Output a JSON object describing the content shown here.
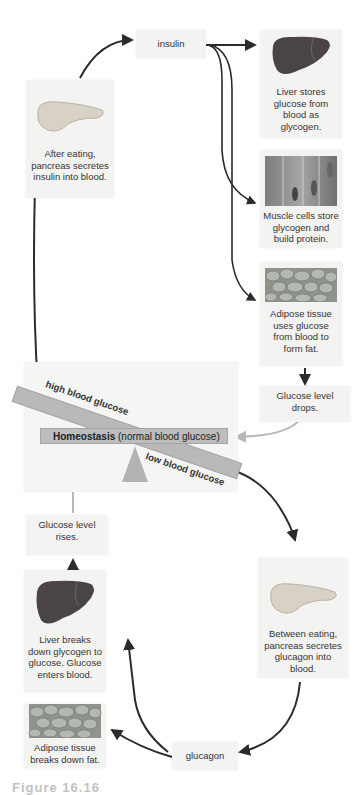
{
  "diagram": {
    "insulin_label": "insulin",
    "glucagon_label": "glucagon",
    "after_eating": "After eating, pancreas secretes insulin into blood.",
    "liver_stores": "Liver stores glucose from blood as glycogen.",
    "muscle_cells": "Muscle cells store glycogen and build protein.",
    "adipose_uses": "Adipose tissue uses glucose from blood to form fat.",
    "glucose_drops": "Glucose level drops.",
    "homeostasis_bold": "Homeostasis",
    "homeostasis_rest": " (normal blood glucose)",
    "high_label": "high blood glucose",
    "low_label": "low blood glucose",
    "glucose_rises": "Glucose level rises.",
    "liver_breaks": "Liver breaks down glycogen to glucose. Glucose enters blood.",
    "between_eating": "Between eating, pancreas secretes glucagon into blood.",
    "adipose_breaks": "Adipose tissue breaks down fat.",
    "caption": "Figure 16.16"
  },
  "colors": {
    "box_bg": "#f3f3f2",
    "seesaw": "#b9b9b9",
    "dark_arrow": "#2b2b2b",
    "grey_arrow": "#b8b8b8",
    "liver": "#4a4444",
    "pancreas": "#d8d2c6"
  }
}
